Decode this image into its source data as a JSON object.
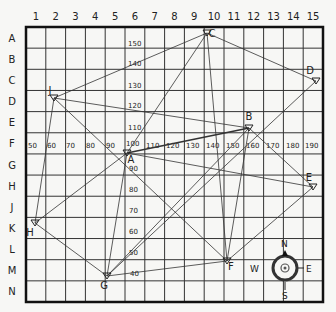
{
  "map": {
    "columns": [
      "1",
      "2",
      "3",
      "4",
      "5",
      "6",
      "7",
      "8",
      "9",
      "10",
      "11",
      "12",
      "13",
      "14",
      "15"
    ],
    "rows": [
      "A",
      "B",
      "C",
      "D",
      "E",
      "F",
      "G",
      "H",
      "J",
      "K",
      "L",
      "M",
      "N"
    ],
    "vertical_scale": [
      {
        "label": "150",
        "x": 128,
        "y": 46
      },
      {
        "label": "140",
        "x": 128,
        "y": 66
      },
      {
        "label": "130",
        "x": 128,
        "y": 88
      },
      {
        "label": "120",
        "x": 128,
        "y": 108
      },
      {
        "label": "110",
        "x": 128,
        "y": 130
      },
      {
        "label": "100",
        "x": 126,
        "y": 146
      },
      {
        "label": "90",
        "x": 129,
        "y": 171
      },
      {
        "label": "80",
        "x": 129,
        "y": 192
      },
      {
        "label": "70",
        "x": 129,
        "y": 213
      },
      {
        "label": "60",
        "x": 129,
        "y": 234
      },
      {
        "label": "50",
        "x": 129,
        "y": 255
      },
      {
        "label": "40",
        "x": 130,
        "y": 276
      }
    ],
    "horizontal_scale": [
      {
        "label": "50",
        "x": 28,
        "y": 148
      },
      {
        "label": "60",
        "x": 47,
        "y": 148
      },
      {
        "label": "70",
        "x": 66,
        "y": 148
      },
      {
        "label": "80",
        "x": 86,
        "y": 148
      },
      {
        "label": "90",
        "x": 106,
        "y": 148
      },
      {
        "label": "110",
        "x": 146,
        "y": 148
      },
      {
        "label": "120",
        "x": 166,
        "y": 148
      },
      {
        "label": "130",
        "x": 186,
        "y": 148
      },
      {
        "label": "140",
        "x": 206,
        "y": 148
      },
      {
        "label": "150",
        "x": 226,
        "y": 148
      },
      {
        "label": "160",
        "x": 246,
        "y": 148
      },
      {
        "label": "170",
        "x": 266,
        "y": 148
      },
      {
        "label": "180",
        "x": 286,
        "y": 148
      },
      {
        "label": "190",
        "x": 305,
        "y": 148
      }
    ],
    "points": [
      {
        "id": "A",
        "x": 127,
        "y": 153,
        "lx": 131,
        "ly": 163
      },
      {
        "id": "B",
        "x": 249,
        "y": 128,
        "lx": 249,
        "ly": 120
      },
      {
        "id": "C",
        "x": 207,
        "y": 33,
        "lx": 212,
        "ly": 37
      },
      {
        "id": "D",
        "x": 316,
        "y": 81,
        "lx": 310,
        "ly": 74
      },
      {
        "id": "E",
        "x": 313,
        "y": 187,
        "lx": 309,
        "ly": 181
      },
      {
        "id": "F",
        "x": 227,
        "y": 261,
        "lx": 231,
        "ly": 270
      },
      {
        "id": "G",
        "x": 107,
        "y": 276,
        "lx": 104,
        "ly": 289
      },
      {
        "id": "H",
        "x": 35,
        "y": 223,
        "lx": 30,
        "ly": 236
      },
      {
        "id": "J",
        "x": 54,
        "y": 98,
        "lx": 50,
        "ly": 94
      }
    ],
    "connections": [
      [
        "J",
        "C"
      ],
      [
        "C",
        "D"
      ],
      [
        "C",
        "A"
      ],
      [
        "C",
        "F"
      ],
      [
        "D",
        "G"
      ],
      [
        "J",
        "B"
      ],
      [
        "J",
        "H"
      ],
      [
        "J",
        "F"
      ],
      [
        "A",
        "B"
      ],
      [
        "A",
        "E"
      ],
      [
        "A",
        "H"
      ],
      [
        "A",
        "G"
      ],
      [
        "G",
        "B"
      ],
      [
        "B",
        "F"
      ],
      [
        "B",
        "E"
      ],
      [
        "H",
        "G"
      ],
      [
        "G",
        "F"
      ],
      [
        "F",
        "E"
      ]
    ],
    "compass": {
      "north": "N",
      "south": "S",
      "east": "E",
      "west": "W"
    }
  }
}
